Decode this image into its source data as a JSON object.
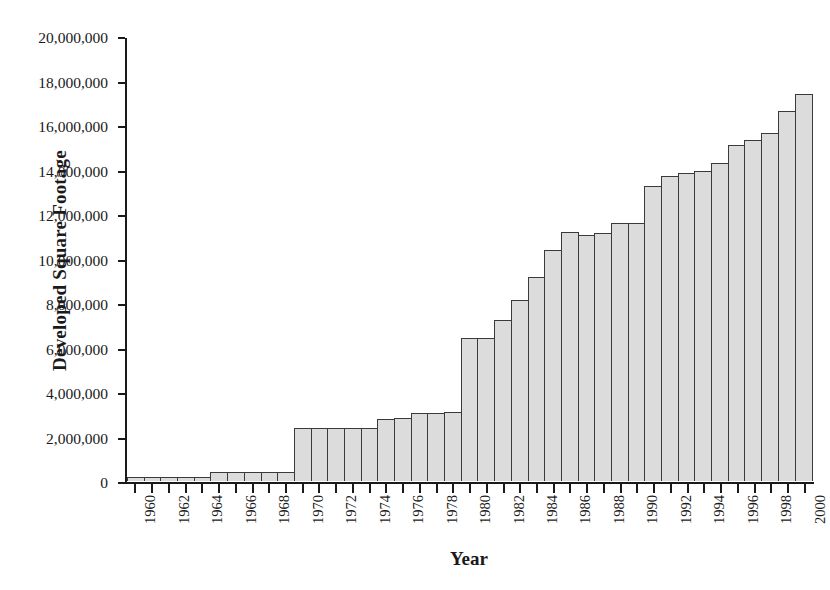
{
  "chart_data": {
    "type": "bar",
    "title": "",
    "xlabel": "Year",
    "ylabel": "Developed Square Footage",
    "ylim": [
      0,
      20000000
    ],
    "ytick_values": [
      0,
      2000000,
      4000000,
      6000000,
      8000000,
      10000000,
      12000000,
      14000000,
      16000000,
      18000000,
      20000000
    ],
    "ytick_labels": [
      "0",
      "2,000,000",
      "4,000,000",
      "6,000,000",
      "8,000,000",
      "10,000,000",
      "12,000,000",
      "14,000,000",
      "16,000,000",
      "18,000,000",
      "20,000,000"
    ],
    "grid": false,
    "legend": "none",
    "xtick_label_rotation": -90,
    "xtick_label_interval": 2,
    "categories": [
      "1960",
      "1961",
      "1962",
      "1963",
      "1964",
      "1965",
      "1966",
      "1967",
      "1968",
      "1969",
      "1970",
      "1971",
      "1972",
      "1973",
      "1974",
      "1975",
      "1976",
      "1977",
      "1978",
      "1979",
      "1980",
      "1981",
      "1982",
      "1983",
      "1984",
      "1985",
      "1986",
      "1987",
      "1988",
      "1989",
      "1990",
      "1991",
      "1992",
      "1993",
      "1994",
      "1995",
      "1996",
      "1997",
      "1998",
      "1999",
      "2000"
    ],
    "xtick_labels": [
      "1960",
      "",
      "1962",
      "",
      "1964",
      "",
      "1966",
      "",
      "1968",
      "",
      "1970",
      "",
      "1972",
      "",
      "1974",
      "",
      "1976",
      "",
      "1978",
      "",
      "1980",
      "",
      "1982",
      "",
      "1984",
      "",
      "1986",
      "",
      "1988",
      "",
      "1990",
      "",
      "1992",
      "",
      "1994",
      "",
      "1996",
      "",
      "1998",
      "",
      "2000"
    ],
    "values": [
      200000,
      200000,
      200000,
      200000,
      200000,
      400000,
      400000,
      400000,
      400000,
      400000,
      2400000,
      2400000,
      2400000,
      2400000,
      2400000,
      2800000,
      2850000,
      3050000,
      3080000,
      3100000,
      6450000,
      6450000,
      7250000,
      8150000,
      9200000,
      10450000,
      11250000,
      11100000,
      11200000,
      11650000,
      11650000,
      13300000,
      13750000,
      13900000,
      14000000,
      14350000,
      15150000,
      15400000,
      15700000,
      16700000,
      17450000
    ],
    "bar_style": {
      "fill": "#dcdcdc",
      "edge": "#3a3a3a",
      "gap": 0
    }
  }
}
